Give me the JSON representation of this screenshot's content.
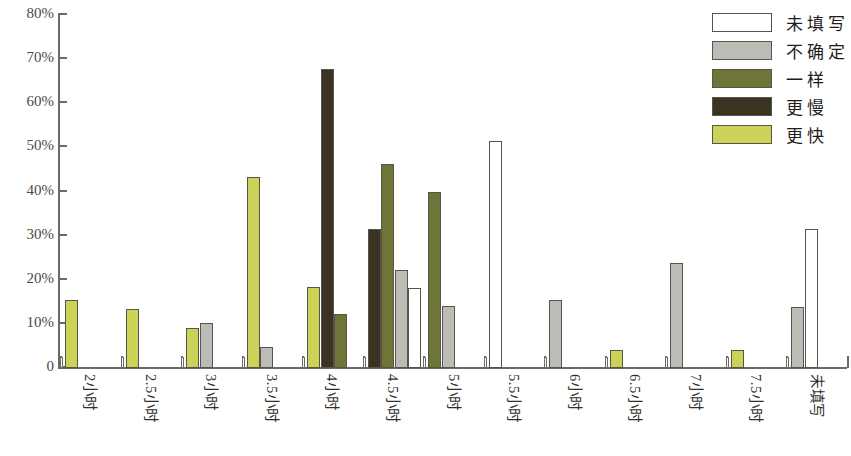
{
  "chart_data": {
    "type": "bar",
    "title": "",
    "xlabel": "",
    "ylabel": "",
    "ylim": [
      0,
      80
    ],
    "ytick_labels": [
      "80%",
      "70%",
      "60%",
      "50%",
      "40%",
      "30%",
      "20%",
      "10%",
      "0"
    ],
    "ytick_values": [
      80,
      70,
      60,
      50,
      40,
      30,
      20,
      10,
      0
    ],
    "grid": false,
    "legend_position": "top-right",
    "categories": [
      "2 小时",
      "2.5 小时",
      "3 小时",
      "3.5 小时",
      "4 小时",
      "4.5 小时",
      "5 小时",
      "5.5 小时",
      "6 小时",
      "6.5 小时",
      "7 小时",
      "7.5 小时",
      "未填写"
    ],
    "series": [
      {
        "name": "更快",
        "color": "#ccd158",
        "values": [
          15.5,
          13.3,
          9.0,
          43.2,
          18.4,
          0,
          0,
          0,
          0,
          4.0,
          0,
          4.0,
          0
        ]
      },
      {
        "name": "更慢",
        "color": "#3a3324",
        "values": [
          0,
          0,
          0,
          0,
          67.8,
          31.4,
          0,
          0,
          0,
          0,
          0,
          0,
          0
        ]
      },
      {
        "name": "一样",
        "color": "#6f7536",
        "values": [
          0,
          0,
          0,
          0,
          12.3,
          46.2,
          39.9,
          0,
          0,
          0,
          0,
          0,
          0
        ]
      },
      {
        "name": "不确定",
        "color": "#bcbcb6",
        "values": [
          0,
          0,
          10.1,
          4.8,
          0,
          22.1,
          14.1,
          0,
          15.5,
          0,
          23.9,
          0,
          13.9
        ]
      },
      {
        "name": "未填写",
        "color": "#ffffff",
        "values": [
          0,
          0,
          0,
          0,
          0,
          18.1,
          0,
          51.4,
          0,
          0,
          0,
          0,
          31.4
        ]
      }
    ]
  },
  "legend": {
    "items": [
      {
        "label": "未填写",
        "color": "#ffffff"
      },
      {
        "label": "不确定",
        "color": "#bcbcb6"
      },
      {
        "label": "一样",
        "color": "#6f7536"
      },
      {
        "label": "更慢",
        "color": "#3a3324"
      },
      {
        "label": "更快",
        "color": "#ccd158"
      }
    ]
  }
}
